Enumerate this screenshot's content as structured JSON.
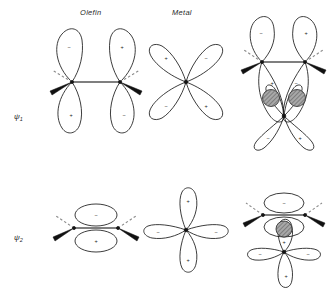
{
  "figure": {
    "background_color": "#ffffff",
    "line_color": "#1a1a1a",
    "overlap_fill_color": "#9a9a9a",
    "bond_color": "#555555"
  },
  "column_headers": {
    "olefin": "Olefin",
    "metal": "Metal"
  },
  "row_labels": {
    "psi1_base": "ψ",
    "psi1_sub": "1",
    "psi2_base": "ψ",
    "psi2_sub": "2"
  },
  "signs": {
    "plus": "+",
    "minus": "−"
  },
  "rows": [
    {
      "name": "psi1",
      "label": "ψ1",
      "olefin": {
        "orbital_type": "p-pair (antisymmetric π*)",
        "lobes": [
          {
            "position": "left-top",
            "sign": "−"
          },
          {
            "position": "left-bottom",
            "sign": "+"
          },
          {
            "position": "right-top",
            "sign": "+"
          },
          {
            "position": "right-bottom",
            "sign": "−"
          }
        ]
      },
      "metal": {
        "orbital_type": "d-orbital, four lobes, diagonal (xy)",
        "lobes": [
          {
            "position": "upper-left",
            "sign": "+"
          },
          {
            "position": "upper-right",
            "sign": "−"
          },
          {
            "position": "lower-left",
            "sign": "−"
          },
          {
            "position": "lower-right",
            "sign": "+"
          }
        ]
      },
      "complex": {
        "orbital_type": "olefin p-pair overlapping metal d-orbital",
        "overlap_regions": 2,
        "lobes": [
          {
            "position": "olefin-left-top",
            "sign": "−"
          },
          {
            "position": "olefin-right-top",
            "sign": "+"
          },
          {
            "position": "olefin-left-lower",
            "sign": "+"
          },
          {
            "position": "olefin-right-lower",
            "sign": "−"
          },
          {
            "position": "metal-lower-left",
            "sign": "−"
          },
          {
            "position": "metal-lower-right",
            "sign": "+"
          }
        ]
      }
    },
    {
      "name": "psi2",
      "label": "ψ2",
      "olefin": {
        "orbital_type": "π orbital, two ellipse lobes (symmetric)",
        "lobes": [
          {
            "position": "top",
            "sign": "−"
          },
          {
            "position": "bottom",
            "sign": "+"
          }
        ]
      },
      "metal": {
        "orbital_type": "d-orbital, four lobes, axial",
        "lobes": [
          {
            "position": "top",
            "sign": "+"
          },
          {
            "position": "bottom",
            "sign": "+"
          },
          {
            "position": "left",
            "sign": "−"
          },
          {
            "position": "right",
            "sign": "−"
          }
        ]
      },
      "complex": {
        "orbital_type": "olefin π overlapping metal d-orbital",
        "overlap_regions": 1,
        "lobes": [
          {
            "position": "olefin-top",
            "sign": "−"
          },
          {
            "position": "olefin-bottom",
            "sign": "+"
          },
          {
            "position": "metal-left",
            "sign": "−"
          },
          {
            "position": "metal-right",
            "sign": "−"
          },
          {
            "position": "metal-bottom",
            "sign": "+"
          }
        ]
      }
    }
  ]
}
